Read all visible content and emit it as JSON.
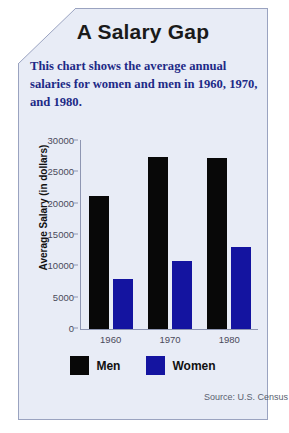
{
  "card": {
    "title": "A Salary Gap",
    "subtitle": "This chart shows the average annual salaries for women and men in 1960, 1970, and 1980.",
    "source": "Source: U.S. Census",
    "fold_icon": "folded-corner"
  },
  "colors": {
    "card_background": "#e8ecf6",
    "card_border": "#9aa3c0",
    "title_text": "#1a1a1a",
    "subtitle_text": "#1d2a86",
    "men_bar": "#080808",
    "women_bar": "#1414a0",
    "axis": "#8e96b2",
    "tick_text": "#4a4a5a"
  },
  "chart_data": {
    "type": "bar",
    "title": "A Salary Gap",
    "categories": [
      "1960",
      "1970",
      "1980"
    ],
    "series": [
      {
        "name": "Men",
        "color": "#080808",
        "values": [
          21300,
          27500,
          27300
        ]
      },
      {
        "name": "Women",
        "color": "#1414a0",
        "values": [
          8000,
          10800,
          13100
        ]
      }
    ],
    "xlabel": "",
    "ylabel": "Average Salary (in dollars)",
    "ylim": [
      0,
      30000
    ],
    "yticks": [
      0,
      5000,
      10000,
      15000,
      20000,
      25000,
      30000
    ],
    "ytick_labels": [
      "0",
      "5000",
      "10000",
      "15000",
      "20000",
      "25000",
      "30000"
    ],
    "grid": false,
    "legend_position": "bottom",
    "annotations": [
      "Source: U.S. Census"
    ]
  }
}
